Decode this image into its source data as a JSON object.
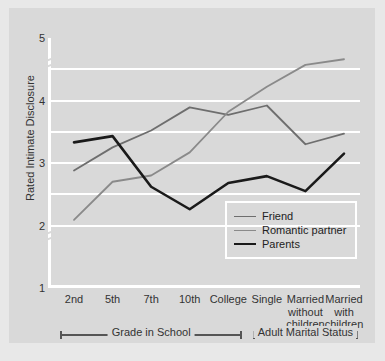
{
  "chart_data": {
    "type": "line",
    "title": "",
    "xlabel": "",
    "ylabel": "Rated Intimate Disclosure",
    "categories": [
      "2nd",
      "5th",
      "7th",
      "10th",
      "College",
      "Single",
      "Married\nwithout\nchildren",
      "Married\nwith\nchildren"
    ],
    "category_labels_flat": [
      "2nd",
      "5th",
      "7th",
      "10th",
      "College",
      "Single",
      "Married without children",
      "Married with children"
    ],
    "ylim": [
      1,
      5
    ],
    "yticks": [
      1,
      2,
      3,
      4,
      5
    ],
    "ytick_labels": [
      "1",
      "2",
      "3",
      "4",
      "5"
    ],
    "gridlines": [
      2.0,
      2.5,
      3.0,
      3.5,
      4.0,
      4.5
    ],
    "grid": true,
    "axis_breaks": [
      {
        "between": [
          1,
          2
        ],
        "position": 1.85
      },
      {
        "between": [
          4,
          5
        ],
        "position": 4.62
      }
    ],
    "legend_position": "inside-lower-right",
    "series": [
      {
        "name": "Friend",
        "color": "#6e6e6e",
        "width": 1.8,
        "values": [
          2.88,
          3.25,
          3.52,
          3.89,
          3.77,
          3.92,
          3.3,
          3.47
        ]
      },
      {
        "name": "Romantic partner",
        "color": "#8a8a8a",
        "width": 1.8,
        "values": [
          2.09,
          2.7,
          2.8,
          3.17,
          3.82,
          4.22,
          4.57,
          4.66
        ]
      },
      {
        "name": "Parents",
        "color": "#1a1a1a",
        "width": 2.6,
        "values": [
          3.33,
          3.43,
          2.62,
          2.26,
          2.68,
          2.79,
          2.55,
          3.15
        ]
      }
    ],
    "group_brackets": [
      {
        "label": "Grade in School",
        "from_index": 0,
        "to_index": 4
      },
      {
        "label": "Adult Marital Status",
        "from_index": 5,
        "to_index": 7
      }
    ]
  },
  "colors": {
    "figure_background": "#d9d9d9",
    "page_background": "#e8e8e8",
    "gridline": "#ffffff",
    "axis": "#ffffff",
    "text": "#333333",
    "bracket": "#555555"
  }
}
